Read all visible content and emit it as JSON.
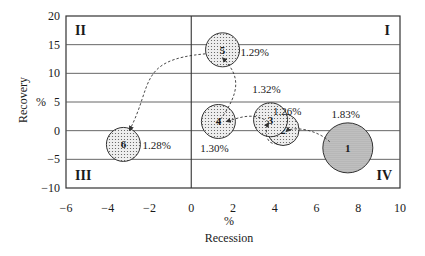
{
  "chart_data": {
    "type": "scatter",
    "subtype": "bubble",
    "title": "",
    "xlabel": "Recession",
    "xlabel_unit": "%",
    "ylabel": "Recovery",
    "ylabel_unit": "%",
    "xlim": [
      -6,
      10
    ],
    "ylim": [
      -10,
      20
    ],
    "xticks": [
      -6,
      -4,
      -2,
      0,
      2,
      4,
      6,
      8,
      10
    ],
    "yticks": [
      -10,
      -5,
      0,
      5,
      10,
      15,
      20
    ],
    "xtick_labels": [
      "−6",
      "−4",
      "−2",
      "0",
      "2",
      "4",
      "6",
      "8",
      "10"
    ],
    "ytick_labels": [
      "−10",
      "−5",
      "0",
      "5",
      "10",
      "15",
      "20"
    ],
    "grid": {
      "horizontal": true,
      "vertical": false
    },
    "quadrant_labels": [
      {
        "label": "I",
        "position": "top-right"
      },
      {
        "label": "II",
        "position": "top-left"
      },
      {
        "label": "III",
        "position": "bottom-left"
      },
      {
        "label": "IV",
        "position": "bottom-right"
      }
    ],
    "points": [
      {
        "id": "1",
        "x": 7.5,
        "y": -3.0,
        "size_label": "1.83%",
        "size": 1.83
      },
      {
        "id": "2",
        "x": 4.4,
        "y": 0.2,
        "size_label": "1.26%",
        "size": 1.26
      },
      {
        "id": "3",
        "x": 3.8,
        "y": 1.9,
        "size_label": "1.32%",
        "size": 1.32
      },
      {
        "id": "4",
        "x": 1.3,
        "y": 1.6,
        "size_label": "1.30%",
        "size": 1.3
      },
      {
        "id": "5",
        "x": 1.5,
        "y": 14.1,
        "size_label": "1.29%",
        "size": 1.29
      },
      {
        "id": "6",
        "x": -3.25,
        "y": -2.4,
        "size_label": "1.28%",
        "size": 1.28
      }
    ],
    "trajectory": [
      "1",
      "2",
      "3",
      "4",
      "5",
      "6"
    ],
    "trajectory_style": "dashed with arrows"
  }
}
